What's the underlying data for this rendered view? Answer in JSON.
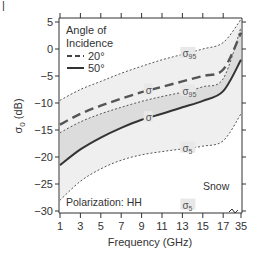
{
  "chart_data": {
    "type": "line",
    "title": "",
    "xlabel": "Frequency (GHz)",
    "ylabel": "σ0 (dB)",
    "x_ticks": [
      "1",
      "3",
      "5",
      "7",
      "9",
      "11",
      "13",
      "15",
      "17",
      "35"
    ],
    "x": [
      1,
      3,
      5,
      7,
      9,
      11,
      13,
      15,
      17,
      35
    ],
    "y_ticks": [
      5,
      0,
      -5,
      -10,
      -15,
      -20,
      -25,
      -30
    ],
    "ylim": [
      -30.5,
      5.7
    ],
    "grid": false,
    "legend": {
      "title": "Angle of Incidence",
      "placement": "top-left",
      "entries": [
        {
          "label": "20°",
          "style": "dashed"
        },
        {
          "label": "50°",
          "style": "solid"
        }
      ]
    },
    "series": [
      {
        "name": "20° σ95",
        "style": "dotted",
        "values": [
          -9.5,
          -7.5,
          -6,
          -4.5,
          -3.2,
          -2,
          -1,
          0,
          1.2,
          5.5
        ]
      },
      {
        "name": "20° σ",
        "style": "dashed",
        "values": [
          -14,
          -12,
          -10.5,
          -9.2,
          -8,
          -7,
          -6,
          -5,
          -3.8,
          3
        ]
      },
      {
        "name": "50° σ95",
        "style": "dotted",
        "values": [
          -15.5,
          -13.5,
          -12,
          -10.8,
          -9.7,
          -8.8,
          -8,
          -7,
          -5.5,
          4
        ]
      },
      {
        "name": "50° σ",
        "style": "solid",
        "values": [
          -21.5,
          -18.6,
          -16.4,
          -14.6,
          -13.1,
          -12,
          -10.8,
          -9.6,
          -7.8,
          -2
        ]
      },
      {
        "name": "50° σ5",
        "style": "dotted",
        "values": [
          -28,
          -24.5,
          -22.2,
          -20.6,
          -19.6,
          -19,
          -18.5,
          -18,
          -17,
          -12
        ]
      }
    ],
    "curve_labels": [
      {
        "text": "σ",
        "sub": "95",
        "series": "20° σ95",
        "x": 13.2
      },
      {
        "text": "σ",
        "sub": "95",
        "series": "50° σ95",
        "x": 13.2
      },
      {
        "text": "σ",
        "series": "20° σ",
        "x": 9.6
      },
      {
        "text": "σ",
        "series": "50° σ",
        "x": 9.6
      },
      {
        "text": "σ",
        "sub": "5",
        "series": "50° σ5",
        "x": 13.2
      },
      {
        "text": "σ",
        "sub": "5",
        "series": "lower-σ5",
        "x": 13.2
      }
    ],
    "annotations": {
      "polarization": "Polarization: HH",
      "medium": "Snow"
    }
  },
  "panel_marker": "|"
}
